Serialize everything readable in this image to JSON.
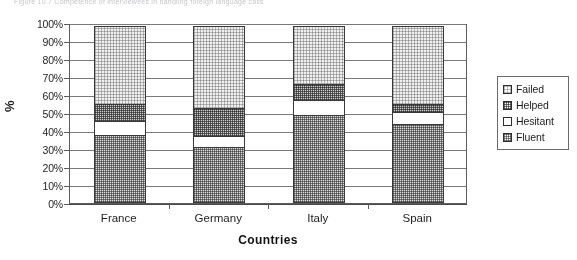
{
  "figure": {
    "caption": "Figure 10.7  Competence of interviewees in handling foreign language calls"
  },
  "chart_data": {
    "type": "bar",
    "stacked": true,
    "stack_mode": "percent",
    "title": "",
    "xlabel": "Countries",
    "ylabel": "%",
    "ylim": [
      0,
      100
    ],
    "ytick_labels": [
      "0%",
      "10%",
      "20%",
      "30%",
      "40%",
      "50%",
      "60%",
      "70%",
      "80%",
      "90%",
      "100%"
    ],
    "ytick_values": [
      0,
      10,
      20,
      30,
      40,
      50,
      60,
      70,
      80,
      90,
      100
    ],
    "grid": true,
    "legend_position": "right",
    "categories": [
      "France",
      "Germany",
      "Italy",
      "Spain"
    ],
    "stack_order_bottom_to_top": [
      "Fluent",
      "Hesitant",
      "Helped",
      "Failed"
    ],
    "series": [
      {
        "name": "Fluent",
        "values": [
          38,
          31,
          49,
          44
        ],
        "pattern": "medium-dots"
      },
      {
        "name": "Hesitant",
        "values": [
          8,
          7,
          9,
          7
        ],
        "pattern": "blank"
      },
      {
        "name": "Helped",
        "values": [
          10,
          16,
          9,
          5
        ],
        "pattern": "dense-dots"
      },
      {
        "name": "Failed",
        "values": [
          44,
          46,
          33,
          44
        ],
        "pattern": "light-dots"
      }
    ],
    "legend_entries": [
      {
        "label": "Failed",
        "pattern": "light-dots"
      },
      {
        "label": "Helped",
        "pattern": "dense-dots"
      },
      {
        "label": "Hesitant",
        "pattern": "blank"
      },
      {
        "label": "Fluent",
        "pattern": "medium-dots"
      }
    ]
  }
}
